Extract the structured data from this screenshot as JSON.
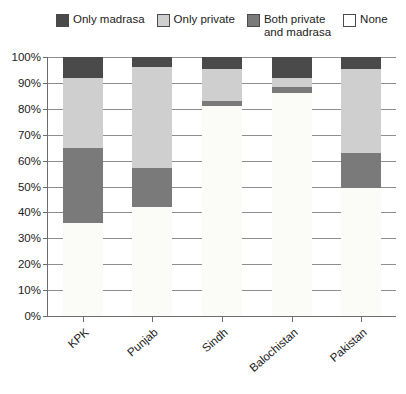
{
  "chart_data": {
    "type": "bar",
    "stacked": true,
    "title": "",
    "subtitle": "",
    "xlabel": "",
    "ylabel": "",
    "ylim": [
      0,
      100
    ],
    "grid": true,
    "legend_position": "top",
    "categories": [
      "KPK",
      "Punjab",
      "Sindh",
      "Balochistan",
      "Pakistan"
    ],
    "ytick_labels": [
      "0%",
      "10%",
      "20%",
      "30%",
      "40%",
      "50%",
      "60%",
      "70%",
      "80%",
      "90%",
      "100%"
    ],
    "ytick_values": [
      0,
      10,
      20,
      30,
      40,
      50,
      60,
      70,
      80,
      90,
      100
    ],
    "series": [
      {
        "name": "None",
        "color": "#fbfbf8",
        "values": [
          36,
          42,
          81,
          86,
          49.5
        ]
      },
      {
        "name": "Both private and madrasa",
        "color": "#7a7a7a",
        "values": [
          29,
          15,
          2,
          2.5,
          13.5
        ]
      },
      {
        "name": "Only private",
        "color": "#cfcfcf",
        "values": [
          27,
          39,
          12.5,
          3.5,
          32.5
        ]
      },
      {
        "name": "Only madrasa",
        "color": "#4a4a4a",
        "values": [
          8,
          4,
          4.5,
          8,
          4.5
        ]
      }
    ]
  },
  "legend": {
    "items": [
      {
        "label": "Only madrasa",
        "color": "#4a4a4a",
        "swatch_name": "only-madrasa"
      },
      {
        "label": "Only private",
        "color": "#cfcfcf",
        "swatch_name": "only-private"
      },
      {
        "label": "Both private\nand madrasa",
        "color": "#7a7a7a",
        "swatch_name": "both-private-and-madrasa"
      },
      {
        "label": "None",
        "color": "#ffffff",
        "swatch_name": "none"
      }
    ]
  }
}
